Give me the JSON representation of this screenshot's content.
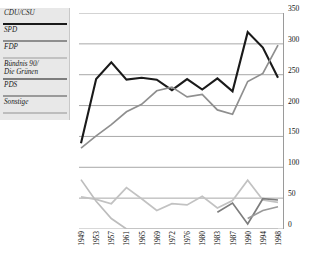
{
  "legend": {
    "items": [
      {
        "label": "CDU/CSU",
        "color": "#1a1a1a",
        "lines": 1
      },
      {
        "label": "SPD",
        "color": "#8f8f8f",
        "lines": 1
      },
      {
        "label": "FDP",
        "color": "#c2c2c2",
        "lines": 1
      },
      {
        "label": "Bündnis 90/\nDie Grünen",
        "color": "#7d7d7d",
        "lines": 2
      },
      {
        "label": "PDS",
        "color": "#9a9a9a",
        "lines": 1
      },
      {
        "label": "Sonstige",
        "color": "#bdbdbd",
        "lines": 1
      }
    ]
  },
  "axes": {
    "y_ticks": [
      "0",
      "50",
      "100",
      "150",
      "200",
      "250",
      "300",
      "350"
    ],
    "x_ticks": [
      "1949",
      "1953",
      "1957",
      "1961",
      "1965",
      "1969",
      "1972",
      "1976",
      "1980",
      "1983",
      "1987",
      "1990",
      "1994",
      "1998"
    ]
  },
  "chart_data": {
    "type": "line",
    "title": "",
    "xlabel": "",
    "ylabel": "",
    "ylim": [
      0,
      350
    ],
    "ytick_step": 50,
    "grid": true,
    "legend_position": "left",
    "categories": [
      "1949",
      "1953",
      "1957",
      "1961",
      "1965",
      "1969",
      "1972",
      "1976",
      "1980",
      "1983",
      "1987",
      "1990",
      "1994",
      "1998"
    ],
    "series": [
      {
        "name": "CDU/CSU",
        "color": "#1a1a1a",
        "values": [
          139,
          243,
          270,
          242,
          245,
          242,
          225,
          243,
          226,
          244,
          223,
          319,
          294,
          245
        ]
      },
      {
        "name": "SPD",
        "color": "#8f8f8f",
        "values": [
          131,
          151,
          169,
          190,
          202,
          224,
          230,
          214,
          218,
          193,
          186,
          239,
          252,
          298
        ]
      },
      {
        "name": "FDP",
        "color": "#c2c2c2",
        "values": [
          52,
          48,
          41,
          67,
          49,
          30,
          41,
          39,
          53,
          34,
          46,
          79,
          47,
          43
        ]
      },
      {
        "name": "Bündnis 90/Die Grünen",
        "color": "#7d7d7d",
        "values": [
          null,
          null,
          null,
          null,
          null,
          null,
          null,
          null,
          null,
          27,
          42,
          8,
          49,
          47
        ]
      },
      {
        "name": "PDS",
        "color": "#9a9a9a",
        "values": [
          null,
          null,
          null,
          null,
          null,
          null,
          null,
          null,
          null,
          null,
          null,
          17,
          30,
          36
        ]
      },
      {
        "name": "Sonstige",
        "color": "#bdbdbd",
        "values": [
          80,
          45,
          17,
          0,
          0,
          0,
          0,
          0,
          0,
          0,
          0,
          0,
          0,
          0
        ]
      }
    ]
  }
}
